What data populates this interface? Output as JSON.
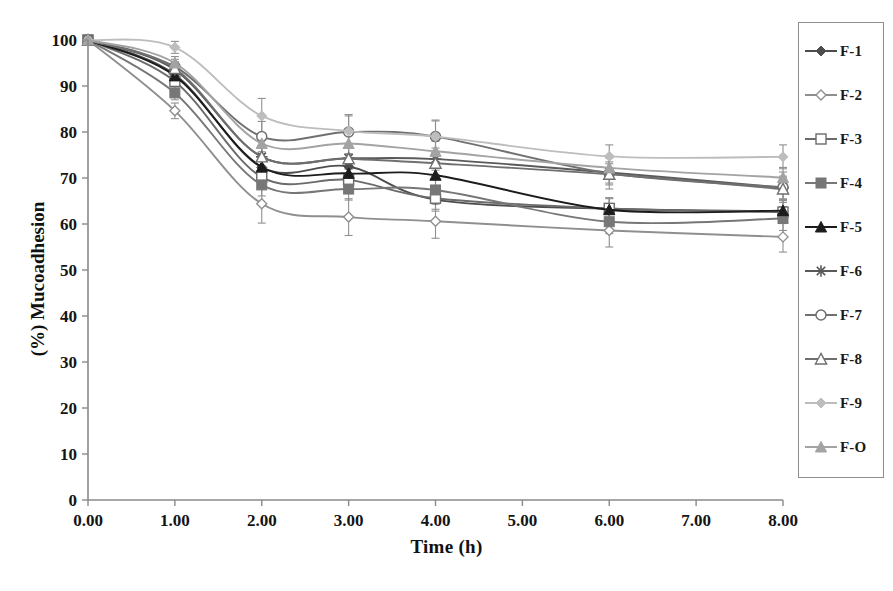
{
  "chart_data": {
    "type": "line",
    "title": "",
    "xlabel": "Time (h)",
    "ylabel": "(%) Mucoadhesion",
    "xlim": [
      0,
      8
    ],
    "ylim": [
      0,
      100
    ],
    "xticks": [
      "0.00",
      "1.00",
      "2.00",
      "3.00",
      "4.00",
      "5.00",
      "6.00",
      "7.00",
      "8.00"
    ],
    "yticks": [
      "0",
      "10",
      "20",
      "30",
      "40",
      "50",
      "60",
      "70",
      "80",
      "90",
      "100"
    ],
    "grid": false,
    "legend_position": "right-outside",
    "x": [
      0,
      1,
      2,
      3,
      4,
      6,
      8
    ],
    "series": [
      {
        "name": "F-1",
        "marker": "filled-diamond",
        "color": "#4d4d4d",
        "values": [
          100,
          92.5,
          72.3,
          72.5,
          65.3,
          63.3,
          62.8
        ],
        "errors": [
          0,
          1.6,
          2.4,
          2.6,
          2.5,
          2.4,
          2.6
        ]
      },
      {
        "name": "F-2",
        "marker": "open-diamond",
        "color": "#8f8f8f",
        "values": [
          100,
          84.6,
          64.4,
          61.5,
          60.6,
          58.6,
          57.2
        ],
        "errors": [
          0,
          1.7,
          4.2,
          4.0,
          3.7,
          3.6,
          3.3
        ]
      },
      {
        "name": "F-3",
        "marker": "open-square",
        "color": "#6b6b6b",
        "values": [
          100,
          91.0,
          70.2,
          69.6,
          65.6,
          63.4,
          62.6
        ],
        "errors": [
          0,
          1.5,
          2.3,
          2.5,
          2.4,
          2.3,
          2.5
        ]
      },
      {
        "name": "F-4",
        "marker": "filled-square",
        "color": "#777777",
        "values": [
          100,
          88.5,
          68.5,
          67.6,
          67.4,
          60.5,
          61.2
        ],
        "errors": [
          0,
          1.5,
          2.4,
          2.4,
          2.4,
          2.6,
          2.6
        ]
      },
      {
        "name": "F-5",
        "marker": "filled-triangle",
        "color": "#1c1c1c",
        "values": [
          100,
          92.2,
          72.4,
          71.0,
          70.6,
          63.1,
          62.9
        ],
        "errors": [
          0,
          1.5,
          2.2,
          2.4,
          2.4,
          2.4,
          2.5
        ]
      },
      {
        "name": "F-6",
        "marker": "asterisk",
        "color": "#5a5a5a",
        "values": [
          100,
          93.5,
          74.6,
          74.3,
          74.1,
          71.2,
          67.9
        ],
        "errors": [
          0,
          1.5,
          2.3,
          2.3,
          2.4,
          2.3,
          2.5
        ]
      },
      {
        "name": "F-7",
        "marker": "open-circle",
        "color": "#707070",
        "values": [
          100,
          94.2,
          79.0,
          80.0,
          79.0,
          71.0,
          68.0
        ],
        "errors": [
          0,
          1.6,
          3.3,
          3.5,
          3.4,
          3.4,
          3.3
        ]
      },
      {
        "name": "F-8",
        "marker": "open-triangle",
        "color": "#6f6f6f",
        "values": [
          100,
          93.8,
          74.6,
          74.2,
          73.2,
          70.8,
          67.6
        ],
        "errors": [
          0,
          1.5,
          2.2,
          2.3,
          2.4,
          2.3,
          2.4
        ]
      },
      {
        "name": "F-9",
        "marker": "light-diamond",
        "color": "#bdbdbd",
        "values": [
          100,
          98.4,
          83.5,
          80.2,
          79.0,
          74.7,
          74.6
        ],
        "errors": [
          0,
          1.3,
          3.8,
          3.6,
          3.6,
          2.5,
          2.6
        ]
      },
      {
        "name": "F-O",
        "marker": "light-triangle",
        "color": "#a3a3a3",
        "values": [
          100,
          95.0,
          77.5,
          77.5,
          75.8,
          72.2,
          70.1
        ],
        "errors": [
          0,
          1.4,
          2.2,
          2.2,
          2.2,
          2.2,
          2.2
        ]
      }
    ]
  },
  "legend": {
    "items": [
      {
        "label": "F-1"
      },
      {
        "label": "F-2"
      },
      {
        "label": "F-3"
      },
      {
        "label": "F-4"
      },
      {
        "label": "F-5"
      },
      {
        "label": "F-6"
      },
      {
        "label": "F-7"
      },
      {
        "label": "F-8"
      },
      {
        "label": "F-9"
      },
      {
        "label": "F-O"
      }
    ]
  },
  "axes": {
    "x_title": "Time (h)",
    "y_title": "(%) Mucoadhesion"
  }
}
